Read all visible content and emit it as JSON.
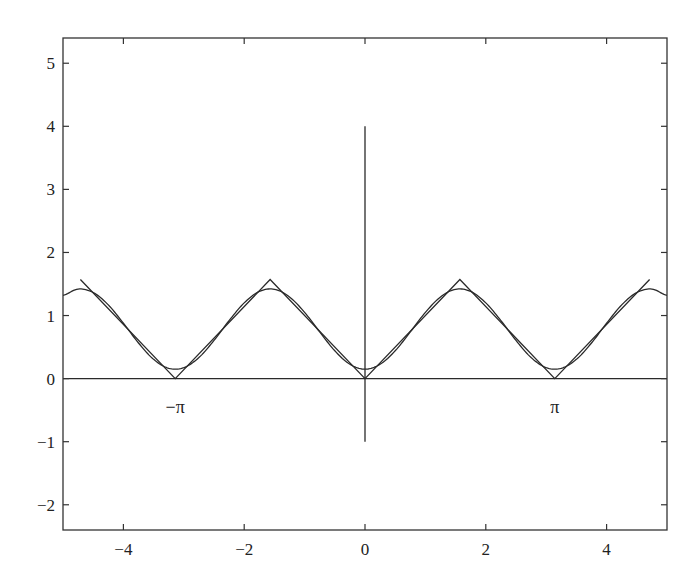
{
  "chart_data": {
    "type": "line",
    "title": "",
    "xlabel": "",
    "ylabel": "",
    "xlim": [
      -5,
      5
    ],
    "ylim": [
      -2.4,
      5.4
    ],
    "grid": false,
    "legend": null,
    "xticks": [
      -4,
      -2,
      0,
      2,
      4
    ],
    "xtick_labels": [
      "−4",
      "−2",
      "0",
      "2",
      "4"
    ],
    "yticks": [
      -2,
      -1,
      0,
      1,
      2,
      3,
      4,
      5
    ],
    "ytick_labels": [
      "−2",
      "−1",
      "0",
      "1",
      "2",
      "3",
      "4",
      "5"
    ],
    "series": [
      {
        "name": "triangle-wave",
        "description": "periodic triangle wave, period pi, min 0 at multiples of pi, max pi/2 at odd multiples of pi/2",
        "x": [
          -4.712,
          -3.1416,
          -1.5708,
          0,
          1.5708,
          3.1416,
          4.712
        ],
        "y": [
          1.5708,
          0,
          1.5708,
          0,
          1.5708,
          0,
          1.5708
        ]
      },
      {
        "name": "fourier-approximation",
        "description": "pi/4 - (2/pi) cos(2x)",
        "x": [
          -5,
          -4.75,
          -4.5,
          -4.25,
          -4,
          -3.75,
          -3.5,
          -3.25,
          -3,
          -2.75,
          -2.5,
          -2.25,
          -2,
          -1.75,
          -1.5,
          -1.25,
          -1,
          -0.75,
          -0.5,
          -0.25,
          0,
          0.25,
          0.5,
          0.75,
          1,
          1.25,
          1.5,
          1.75,
          2,
          2.25,
          2.5,
          2.75,
          3,
          3.25,
          3.5,
          3.75,
          4,
          4.25,
          4.5,
          4.75,
          5
        ],
        "y": [
          1.319,
          1.42,
          1.365,
          1.169,
          0.878,
          0.565,
          0.305,
          0.164,
          0.174,
          0.334,
          0.605,
          0.92,
          1.201,
          1.382,
          1.416,
          1.295,
          1.05,
          0.74,
          0.441,
          0.227,
          0.149,
          0.227,
          0.441,
          0.74,
          1.05,
          1.295,
          1.416,
          1.382,
          1.201,
          0.92,
          0.605,
          0.334,
          0.174,
          0.164,
          0.305,
          0.565,
          0.878,
          1.169,
          1.365,
          1.42,
          1.319
        ]
      },
      {
        "name": "x-axis-line",
        "x": [
          -5,
          5
        ],
        "y": [
          0,
          0
        ]
      },
      {
        "name": "vertical-line-at-zero",
        "x": [
          0,
          0
        ],
        "y": [
          -1,
          4
        ]
      }
    ],
    "annotations": [
      {
        "text": "−π",
        "x": -3.1416,
        "y": -0.55
      },
      {
        "text": "π",
        "x": 3.1416,
        "y": -0.55
      }
    ]
  },
  "style": {
    "line_color": "#2a2a2a",
    "axis_color": "#333333",
    "background": "#ffffff"
  }
}
